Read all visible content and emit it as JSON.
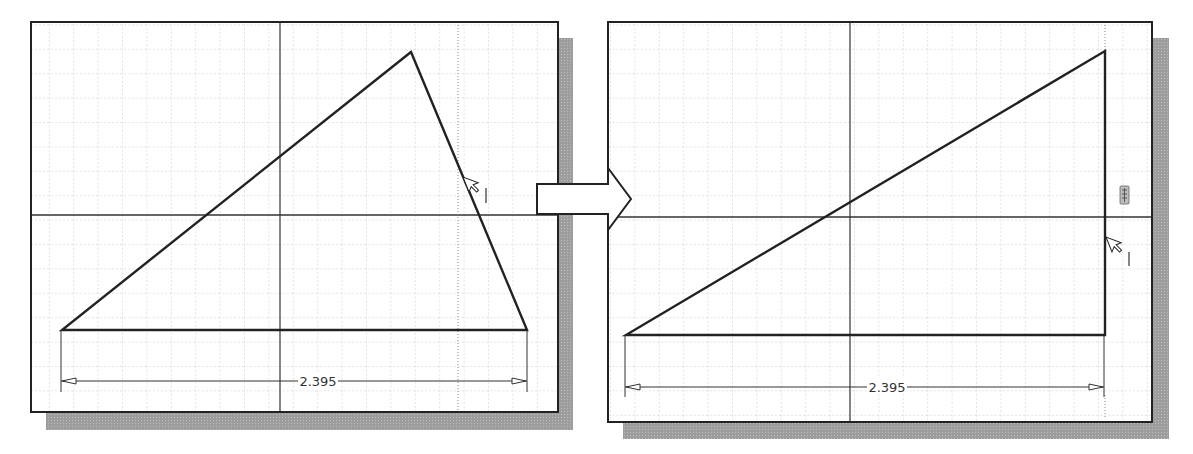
{
  "figure": {
    "colors": {
      "background": "#ffffff",
      "frame": "#222222",
      "shadow": "#9a9a9a",
      "grid": "#c8c8c8",
      "axis": "#333333",
      "geometry": "#222222",
      "dimension": "#333333"
    }
  },
  "panels": [
    {
      "name": "before",
      "frame": {
        "x": 31,
        "y": 22,
        "w": 527,
        "h": 390
      },
      "origin": {
        "x": 280,
        "y": 215
      },
      "triangle": [
        [
          62,
          330
        ],
        [
          527,
          330
        ],
        [
          411,
          52
        ]
      ],
      "dimension": {
        "label": "2.395",
        "x1": 62,
        "x2": 527,
        "y": 381,
        "ext_bottom": 392
      },
      "cursor": {
        "x": 463,
        "y": 177,
        "label": "I"
      },
      "dotted_guide_x": 458
    },
    {
      "name": "after",
      "frame": {
        "x": 608,
        "y": 22,
        "w": 544,
        "h": 400
      },
      "origin": {
        "x": 850,
        "y": 217
      },
      "triangle": [
        [
          626,
          335
        ],
        [
          1105,
          335
        ],
        [
          1105,
          51
        ]
      ],
      "dimension": {
        "label": "2.395",
        "x1": 626,
        "x2": 1105,
        "y": 387,
        "ext_bottom": 415
      },
      "cursor": {
        "x": 1105,
        "y": 237,
        "label": "I"
      },
      "constraint_icon": {
        "x": 1124,
        "y": 196,
        "name": "vertical-constraint"
      }
    }
  ],
  "transition_arrow": {
    "direction": "right"
  }
}
